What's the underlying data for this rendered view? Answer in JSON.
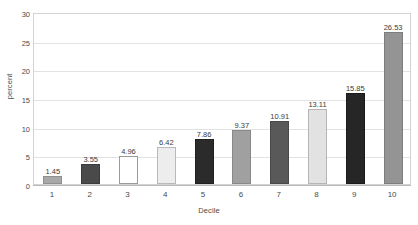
{
  "chart_data": {
    "type": "bar",
    "title": "",
    "subtitle": "",
    "xlabel": "Decile",
    "ylabel": "percent",
    "categories": [
      "1",
      "2",
      "3",
      "4",
      "5",
      "6",
      "7",
      "8",
      "9",
      "10"
    ],
    "values": [
      1.45,
      3.55,
      4.96,
      6.42,
      7.86,
      9.37,
      10.91,
      13.11,
      15.85,
      26.53
    ],
    "value_labels": [
      "1.45",
      "3.55",
      "4.96",
      "6.42",
      "7.86",
      "9.37",
      "10.91",
      "13.11",
      "15.85",
      "26.53"
    ],
    "bar_colors": [
      "#a8a8a8",
      "#4a4a4a",
      "#ffffff",
      "#ededed",
      "#2b2b2b",
      "#a0a0a0",
      "#595959",
      "#e2e2e2",
      "#262626",
      "#949494"
    ],
    "bar_borders": [
      "#8f8f8f",
      "#3b3b3b",
      "#9a9a9a",
      "#b9b9b9",
      "#1f1f1f",
      "#888888",
      "#484848",
      "#b5b5b5",
      "#1a1a1a",
      "#7d7d7d"
    ],
    "ylim": [
      0,
      30
    ],
    "yticks": [
      0,
      5,
      10,
      15,
      20,
      25,
      30
    ],
    "ytick_labels": [
      "0",
      "5",
      "10",
      "15",
      "20",
      "25",
      "30"
    ],
    "grid": true,
    "grid_axis": "y",
    "legend": false,
    "legend_position": "none",
    "axis_color": "#d3d3d3",
    "grid_color": "#e2e2e2",
    "text_color": "#4a4a4a",
    "background": "#ffffff"
  }
}
